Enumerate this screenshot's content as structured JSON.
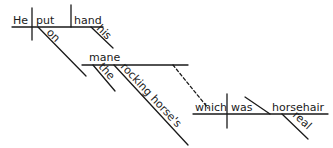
{
  "diagram": {
    "type": "sentence-diagram",
    "sentence": "He put his hand on the rocking horse's mane which was real horsehair",
    "main_clause": {
      "subject": "He",
      "verb": "put",
      "object": "hand",
      "object_modifier": "his",
      "prepositional_phrase": {
        "preposition": "on",
        "object": "mane",
        "modifiers": [
          "the",
          "rocking horse's"
        ]
      }
    },
    "relative_clause": {
      "subject": "which",
      "verb": "was",
      "complement": "horsehair",
      "complement_modifier": "real"
    },
    "words": {
      "he": "He",
      "put": "put",
      "hand": "hand",
      "his": "his",
      "on": "on",
      "mane": "mane",
      "the": "the",
      "rocking_horses": "rocking horse's",
      "which": "which",
      "was": "was",
      "horsehair": "horsehair",
      "real": "real"
    },
    "colors": {
      "ink": "#1a1a1a",
      "background": "#ffffff"
    }
  }
}
